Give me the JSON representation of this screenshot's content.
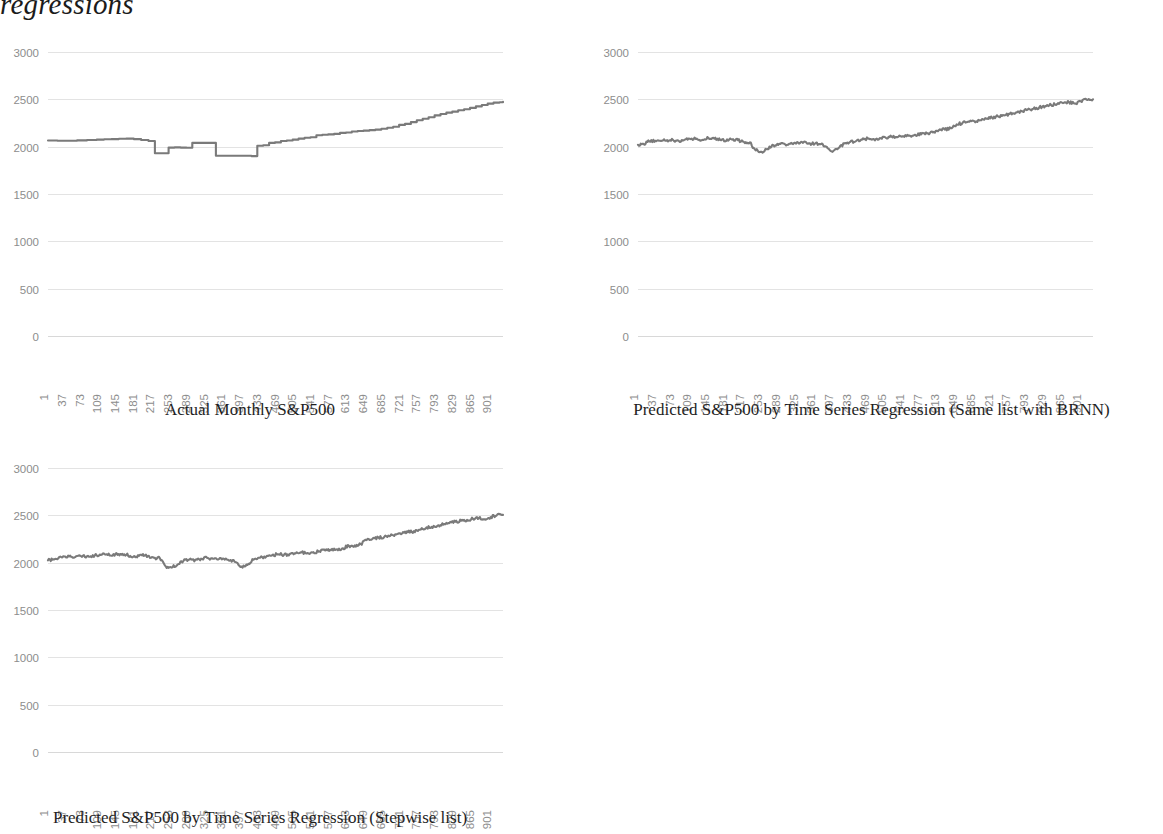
{
  "document": {
    "title": "regressions"
  },
  "charts": [
    {
      "id": "actual",
      "caption": "Actual Monthly S&P500",
      "type": "line",
      "title": "",
      "xlabel": "",
      "ylabel": "",
      "grid": true,
      "legend": "none",
      "line_color": "#7a7a7a",
      "grid_color": "#e3e3e3",
      "tick_color": "#8d8d8d",
      "ylim": [
        0,
        3000
      ],
      "yticks": [
        "3000",
        "2500",
        "2000",
        "1500",
        "1000",
        "500",
        "0"
      ],
      "ytick_values": [
        3000,
        2500,
        2000,
        1500,
        1000,
        500,
        0
      ],
      "xticks": [
        "1",
        "37",
        "73",
        "109",
        "145",
        "181",
        "217",
        "253",
        "289",
        "325",
        "361",
        "397",
        "433",
        "469",
        "505",
        "541",
        "577",
        "613",
        "649",
        "685",
        "721",
        "757",
        "793",
        "829",
        "865",
        "901"
      ],
      "xtick_values": [
        1,
        37,
        73,
        109,
        145,
        181,
        217,
        253,
        289,
        325,
        361,
        397,
        433,
        469,
        505,
        541,
        577,
        613,
        649,
        685,
        721,
        757,
        793,
        829,
        865,
        901
      ],
      "xlim": [
        1,
        925
      ],
      "series_style": "stepped",
      "series": [
        {
          "name": "Actual Monthly S&P500",
          "x": [
            1,
            20,
            40,
            60,
            80,
            100,
            115,
            130,
            145,
            160,
            175,
            190,
            205,
            218,
            232,
            246,
            258,
            270,
            282,
            294,
            306,
            318,
            330,
            342,
            354,
            366,
            378,
            390,
            402,
            414,
            426,
            438,
            450,
            462,
            474,
            486,
            498,
            510,
            522,
            534,
            546,
            558,
            570,
            582,
            594,
            606,
            618,
            630,
            642,
            654,
            666,
            678,
            690,
            702,
            714,
            726,
            738,
            750,
            762,
            774,
            786,
            798,
            810,
            822,
            834,
            846,
            858,
            870,
            882,
            894,
            906,
            918,
            925
          ],
          "y": [
            2065,
            2063,
            2062,
            2066,
            2070,
            2075,
            2078,
            2080,
            2083,
            2085,
            2080,
            2070,
            2060,
            1930,
            1930,
            1990,
            1992,
            1990,
            1988,
            2040,
            2040,
            2040,
            2040,
            1905,
            1905,
            1905,
            1905,
            1905,
            1905,
            1900,
            2010,
            2015,
            2040,
            2045,
            2060,
            2065,
            2075,
            2085,
            2095,
            2100,
            2120,
            2125,
            2130,
            2135,
            2145,
            2150,
            2160,
            2165,
            2170,
            2175,
            2180,
            2190,
            2200,
            2210,
            2230,
            2240,
            2260,
            2280,
            2295,
            2310,
            2330,
            2345,
            2360,
            2370,
            2385,
            2395,
            2410,
            2425,
            2440,
            2455,
            2465,
            2470,
            2475
          ]
        }
      ]
    },
    {
      "id": "brnn",
      "caption": "Predicted S&P500 by Time Series Regression (Same list with BRNN)",
      "type": "line",
      "title": "",
      "xlabel": "",
      "ylabel": "",
      "grid": true,
      "legend": "none",
      "line_color": "#7a7a7a",
      "grid_color": "#e3e3e3",
      "tick_color": "#8d8d8d",
      "ylim": [
        0,
        3000
      ],
      "yticks": [
        "3000",
        "2500",
        "2000",
        "1500",
        "1000",
        "500",
        "0"
      ],
      "ytick_values": [
        3000,
        2500,
        2000,
        1500,
        1000,
        500,
        0
      ],
      "xticks": [
        "1",
        "37",
        "73",
        "109",
        "145",
        "181",
        "217",
        "253",
        "289",
        "325",
        "361",
        "397",
        "433",
        "469",
        "505",
        "541",
        "577",
        "613",
        "649",
        "685",
        "721",
        "757",
        "793",
        "829",
        "865",
        "901"
      ],
      "xtick_values": [
        1,
        37,
        73,
        109,
        145,
        181,
        217,
        253,
        289,
        325,
        361,
        397,
        433,
        469,
        505,
        541,
        577,
        613,
        649,
        685,
        721,
        757,
        793,
        829,
        865,
        901
      ],
      "xlim": [
        1,
        925
      ],
      "series_style": "noisy",
      "series": [
        {
          "name": "Predicted S&P500 (BRNN)",
          "x": [
            1,
            12,
            24,
            36,
            48,
            60,
            72,
            84,
            96,
            108,
            120,
            132,
            144,
            156,
            168,
            180,
            192,
            204,
            216,
            228,
            240,
            252,
            264,
            276,
            288,
            300,
            312,
            324,
            336,
            348,
            360,
            372,
            384,
            396,
            408,
            420,
            432,
            444,
            456,
            468,
            480,
            492,
            504,
            516,
            528,
            540,
            552,
            564,
            576,
            588,
            600,
            612,
            624,
            636,
            648,
            660,
            672,
            684,
            696,
            708,
            720,
            732,
            744,
            756,
            768,
            780,
            792,
            804,
            816,
            828,
            840,
            852,
            864,
            876,
            888,
            900,
            912,
            925
          ],
          "y": [
            2020,
            2030,
            2055,
            2062,
            2060,
            2068,
            2072,
            2060,
            2075,
            2080,
            2085,
            2072,
            2090,
            2085,
            2070,
            2060,
            2075,
            2068,
            2050,
            2045,
            1960,
            1945,
            1975,
            2015,
            2030,
            2025,
            2040,
            2048,
            2040,
            2035,
            2030,
            2025,
            2000,
            1945,
            1985,
            2035,
            2050,
            2060,
            2075,
            2085,
            2080,
            2090,
            2095,
            2105,
            2100,
            2110,
            2118,
            2125,
            2130,
            2140,
            2150,
            2175,
            2180,
            2195,
            2235,
            2250,
            2265,
            2270,
            2280,
            2295,
            2305,
            2320,
            2330,
            2345,
            2360,
            2375,
            2390,
            2400,
            2415,
            2430,
            2440,
            2450,
            2460,
            2470,
            2455,
            2480,
            2495,
            2500
          ]
        }
      ]
    },
    {
      "id": "stepwise",
      "caption": "Predicted S&P500 by Time Series Regression (Stepwise list)",
      "type": "line",
      "title": "",
      "xlabel": "",
      "ylabel": "",
      "grid": true,
      "legend": "none",
      "line_color": "#7a7a7a",
      "grid_color": "#e3e3e3",
      "tick_color": "#8d8d8d",
      "ylim": [
        0,
        3000
      ],
      "yticks": [
        "3000",
        "2500",
        "2000",
        "1500",
        "1000",
        "500",
        "0"
      ],
      "ytick_values": [
        3000,
        2500,
        2000,
        1500,
        1000,
        500,
        0
      ],
      "xticks": [
        "1",
        "37",
        "73",
        "109",
        "145",
        "181",
        "217",
        "253",
        "289",
        "325",
        "361",
        "397",
        "433",
        "469",
        "505",
        "541",
        "577",
        "613",
        "649",
        "685",
        "721",
        "757",
        "793",
        "829",
        "865",
        "901"
      ],
      "xtick_values": [
        1,
        37,
        73,
        109,
        145,
        181,
        217,
        253,
        289,
        325,
        361,
        397,
        433,
        469,
        505,
        541,
        577,
        613,
        649,
        685,
        721,
        757,
        793,
        829,
        865,
        901
      ],
      "xlim": [
        1,
        925
      ],
      "series_style": "noisy",
      "series": [
        {
          "name": "Predicted S&P500 (Stepwise)",
          "x": [
            1,
            12,
            24,
            36,
            48,
            60,
            72,
            84,
            96,
            108,
            120,
            132,
            144,
            156,
            168,
            180,
            192,
            204,
            216,
            228,
            240,
            252,
            264,
            276,
            288,
            300,
            312,
            324,
            336,
            348,
            360,
            372,
            384,
            396,
            408,
            420,
            432,
            444,
            456,
            468,
            480,
            492,
            504,
            516,
            528,
            540,
            552,
            564,
            576,
            588,
            600,
            612,
            624,
            636,
            648,
            660,
            672,
            684,
            696,
            708,
            720,
            732,
            744,
            756,
            768,
            780,
            792,
            804,
            816,
            828,
            840,
            852,
            864,
            876,
            888,
            900,
            912,
            925
          ],
          "y": [
            2025,
            2035,
            2060,
            2065,
            2062,
            2070,
            2075,
            2062,
            2078,
            2082,
            2088,
            2075,
            2092,
            2088,
            2072,
            2062,
            2078,
            2070,
            2052,
            2048,
            1962,
            1948,
            1978,
            2018,
            2032,
            2028,
            2042,
            2050,
            2042,
            2038,
            2032,
            2028,
            2002,
            1948,
            1988,
            2038,
            2052,
            2062,
            2078,
            2088,
            2082,
            2092,
            2098,
            2108,
            2102,
            2112,
            2120,
            2128,
            2132,
            2142,
            2152,
            2178,
            2182,
            2198,
            2238,
            2252,
            2268,
            2272,
            2282,
            2298,
            2308,
            2322,
            2332,
            2348,
            2362,
            2378,
            2392,
            2402,
            2418,
            2432,
            2442,
            2452,
            2462,
            2472,
            2458,
            2482,
            2498,
            2505
          ]
        }
      ]
    }
  ]
}
